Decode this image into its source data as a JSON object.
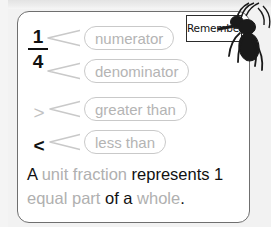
{
  "card": {
    "fraction": {
      "numerator": "1",
      "denominator": "4"
    },
    "symbols": {
      "greater": ">",
      "less": "<"
    },
    "callouts": [
      {
        "id": "numerator",
        "label": "numerator"
      },
      {
        "id": "denominator",
        "label": "denominator"
      },
      {
        "id": "greater",
        "label": "greater than"
      },
      {
        "id": "less",
        "label": "less than"
      }
    ],
    "sentence": {
      "part1": "A ",
      "highlight1": "unit fraction",
      "part2": " represents 1 ",
      "highlight2": "equal part",
      "part3": " of a ",
      "highlight3": "whole",
      "part4": "."
    }
  },
  "remember": {
    "label": "Remember"
  },
  "icons": {
    "ant": "ant-icon",
    "sign": "remember-sign-icon"
  },
  "colors": {
    "page_background": "#f2f2f2",
    "card_background": "#ffffff",
    "card_border": "#6f6f6f",
    "callout_border": "#c9c9c9",
    "callout_text": "#b4b4b4",
    "body_text": "#111111",
    "highlight_text": "#b0b0b0",
    "greater_symbol": "#c2c2c2",
    "less_symbol": "#111111",
    "ant_fill": "#1a1a1a"
  }
}
